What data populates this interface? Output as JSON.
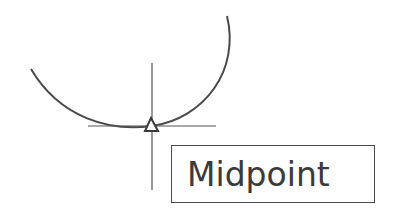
{
  "snap_tooltip": {
    "label": "Midpoint"
  },
  "geometry": {
    "arc": {
      "type": "circular-arc",
      "start": [
        31,
        69
      ],
      "lowest_point": [
        140,
        128
      ],
      "end": [
        227,
        16
      ]
    },
    "crosshair": {
      "center": [
        152,
        126
      ],
      "horizontal_extent": [
        88,
        216
      ],
      "vertical_extent": [
        63,
        190
      ]
    },
    "snap_marker": {
      "shape": "triangle-icon",
      "center": [
        151,
        125
      ]
    }
  },
  "colors": {
    "stroke": "#4a4a4a",
    "background": "#ffffff",
    "text": "#3a3a3a"
  }
}
